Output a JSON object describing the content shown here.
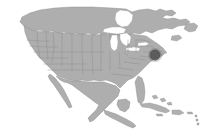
{
  "widget": {
    "name": "north-america-locator-map",
    "type": "locator-map",
    "width": 205,
    "height": 140,
    "background_color": "#ffffff",
    "alt_text": "Map of North America with a marker in the northeastern United States"
  },
  "style": {
    "land_fill": "#aeaeae",
    "land_stroke": "#8e8e8e",
    "state_border": "#8a8a8a",
    "lake_fill": "#ffffff",
    "marker_fill": "#5c5c5c",
    "marker_stroke": "#494949",
    "island_fill": "#b0b0b0"
  },
  "map": {
    "title": "North America",
    "projection": "albers-like",
    "regions": [
      {
        "id": "canada",
        "label": "Canada"
      },
      {
        "id": "united-states",
        "label": "United States"
      },
      {
        "id": "mexico",
        "label": "Mexico"
      },
      {
        "id": "central-america",
        "label": "Central America"
      },
      {
        "id": "caribbean",
        "label": "Caribbean Islands"
      }
    ],
    "features": {
      "state_boundaries_visible": true,
      "country_boundaries_visible": true,
      "great_lakes_visible": true,
      "labels_visible": false,
      "graticule_visible": false
    },
    "water_bodies": [
      {
        "id": "lake-superior",
        "label": "Lake Superior"
      },
      {
        "id": "lake-michigan",
        "label": "Lake Michigan"
      },
      {
        "id": "lake-huron",
        "label": "Lake Huron"
      },
      {
        "id": "lake-erie",
        "label": "Lake Erie"
      },
      {
        "id": "lake-ontario",
        "label": "Lake Ontario"
      },
      {
        "id": "hudson-bay",
        "label": "Hudson Bay"
      },
      {
        "id": "gulf-of-mexico",
        "label": "Gulf of Mexico"
      }
    ]
  },
  "markers": [
    {
      "id": "primary-location-marker",
      "label": "Location marker",
      "region": "Northeastern United States",
      "x": 155,
      "y": 55,
      "radius": 5,
      "color": "#5c5c5c",
      "shape": "circle"
    }
  ]
}
